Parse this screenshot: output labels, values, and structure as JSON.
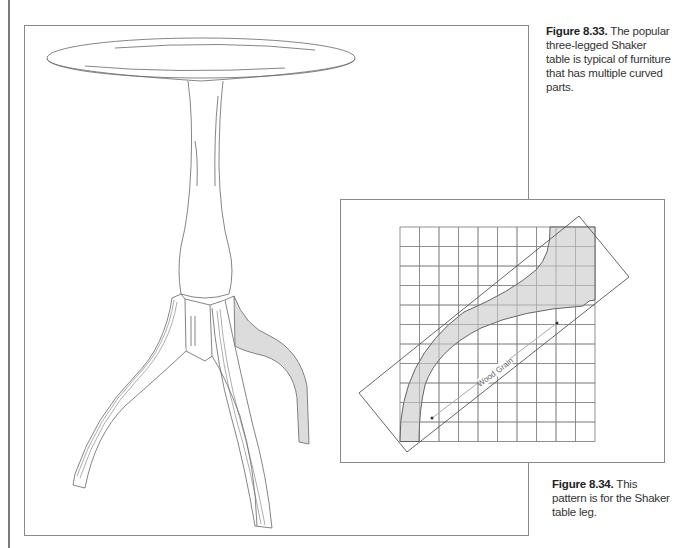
{
  "figures": [
    {
      "number": "Figure 8.33.",
      "caption": " The popular three-legged Shaker table is typical of furniture that has multiple curved parts.",
      "illustration": "shaker-table-drawing"
    },
    {
      "number": "Figure 8.34.",
      "caption": " This pattern is for the Shaker table leg.",
      "illustration": "table-leg-pattern-grid",
      "grid": {
        "columns": 10,
        "rows": 11
      },
      "annotation": "Wood Grain"
    }
  ],
  "colors": {
    "line": "#555555",
    "fill": "#dcdcdc",
    "frame": "#8a8a8a"
  }
}
